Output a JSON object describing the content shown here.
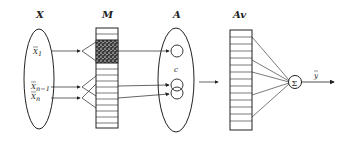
{
  "diagram": {
    "type": "CMAC neural network architecture",
    "stroke_color": "#222222",
    "background": "#ffffff",
    "hatch_color": "#3a3a3a",
    "labels": {
      "input_space": "X",
      "memory": "M",
      "association": "A",
      "actual_memory": "Av",
      "sum_symbol": "Σ",
      "inner_label": "c",
      "output": "y"
    },
    "inputs": [
      {
        "label": "X",
        "subscript": "1"
      },
      {
        "label": "X",
        "subscript": "n−1"
      },
      {
        "label": "X",
        "subscript": "n"
      }
    ],
    "memory_cells": 13,
    "active_memory_cells": 4,
    "actual_memory_cells": 14,
    "association_circles": 3,
    "weighted_connections_to_sum": 5
  }
}
